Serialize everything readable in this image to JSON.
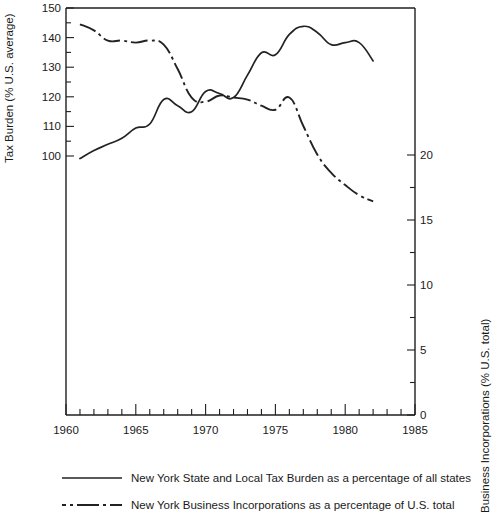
{
  "chart_data": {
    "type": "line",
    "title": "",
    "xlabel": "",
    "xlim": [
      1960,
      1985
    ],
    "xticks": [
      1960,
      1965,
      1970,
      1975,
      1980,
      1985
    ],
    "xtick_labels": [
      "1960",
      "1965",
      "1970",
      "1975",
      "1980",
      "1985"
    ],
    "x_minor_tick_step": 1,
    "grid": false,
    "legend_position": "below-plot",
    "axes": {
      "left": {
        "label": "Tax Burden (% U.S. average)",
        "ylim": [
          50,
          150
        ],
        "ticks": [
          100,
          110,
          120,
          130,
          140,
          150
        ],
        "tick_labels": [
          "100",
          "110",
          "120",
          "130",
          "140",
          "150"
        ],
        "minor_tick_step": 5
      },
      "right": {
        "label": "Business Incorporations (% U.S. total)",
        "ylim": [
          0,
          20
        ],
        "ticks": [
          0,
          5,
          10,
          15,
          20
        ],
        "tick_labels": [
          "0",
          "5",
          "10",
          "15",
          "20"
        ],
        "minor_tick_step": 2.5
      }
    },
    "series": [
      {
        "name": "New York State and Local Tax Burden as a percentage of all states",
        "style": "solid",
        "axis": "left",
        "x": [
          1961,
          1962,
          1963,
          1964,
          1965,
          1966,
          1967,
          1968,
          1969,
          1970,
          1971,
          1972,
          1973,
          1974,
          1975,
          1976,
          1977,
          1978,
          1979,
          1980,
          1981,
          1982
        ],
        "values": [
          113.0,
          115.0,
          116.5,
          118.0,
          120.5,
          121.5,
          127.5,
          126.0,
          124.5,
          129.5,
          129.0,
          128.0,
          133.5,
          139.0,
          138.5,
          143.5,
          145.5,
          144.0,
          141.0,
          141.5,
          141.5,
          137.0
        ]
      },
      {
        "name": "New York Business Incorporations as a percentage of U.S. total",
        "style": "dash-dot",
        "axis": "right",
        "x": [
          1961,
          1962,
          1963,
          1964,
          1965,
          1966,
          1967,
          1968,
          1969,
          1970,
          1971,
          1972,
          1973,
          1974,
          1975,
          1976,
          1977,
          1978,
          1979,
          1980,
          1981,
          1982
        ],
        "values": [
          19.2,
          18.9,
          18.4,
          18.4,
          18.3,
          18.4,
          18.2,
          17.0,
          15.6,
          15.4,
          15.7,
          15.6,
          15.5,
          15.2,
          15.0,
          15.6,
          14.2,
          12.8,
          11.9,
          11.3,
          10.8,
          10.5
        ]
      }
    ],
    "legend": [
      {
        "style": "solid",
        "label": "New York State and Local Tax Burden as a percentage of all states"
      },
      {
        "style": "dash-dot",
        "label": "New York Business Incorporations as a percentage of U.S. total"
      }
    ]
  }
}
